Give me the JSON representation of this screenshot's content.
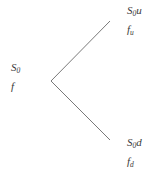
{
  "figure": {
    "type": "one-step-binomial-tree",
    "background_color": "#ffffff",
    "line_color": "#6a6a6a",
    "text_color": "#3a3a3a",
    "width": 162,
    "height": 181
  },
  "nodes": {
    "root": {
      "asset_symbol": "S",
      "asset_subscript": "0",
      "asset_factor": "",
      "option_symbol": "f",
      "option_subscript": ""
    },
    "up": {
      "asset_symbol": "S",
      "asset_subscript": "0",
      "asset_factor": "u",
      "option_symbol": "f",
      "option_subscript": "u"
    },
    "down": {
      "asset_symbol": "S",
      "asset_subscript": "0",
      "asset_factor": "d",
      "option_symbol": "f",
      "option_subscript": "d"
    }
  },
  "branches": {
    "vertex": {
      "x": 51,
      "y": 81
    },
    "up_end": {
      "x": 110,
      "y": 21
    },
    "down_end": {
      "x": 110,
      "y": 140
    },
    "stroke_width": 0.9
  }
}
